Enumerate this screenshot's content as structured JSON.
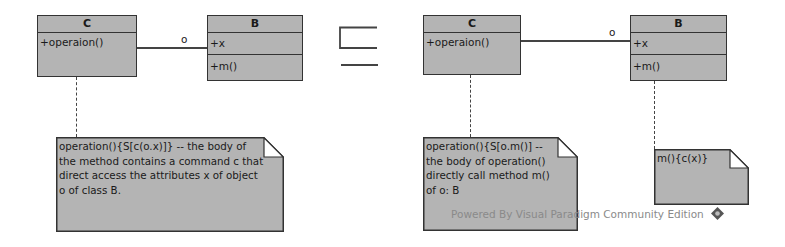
{
  "left_diagram": {
    "class_c": {
      "name": "C",
      "operations": [
        "+operaion()"
      ]
    },
    "class_b": {
      "name": "B",
      "attributes": [
        "+x"
      ],
      "operations": [
        "+m()"
      ]
    },
    "association_label": "o",
    "note": "operation(){S[c(o.x)]} -- the body of the method contains a command c that direct access the attributes x of object o of class B."
  },
  "relation_symbol": "⊑",
  "right_diagram": {
    "class_c": {
      "name": "C",
      "operations": [
        "+operaion()"
      ]
    },
    "class_b": {
      "name": "B",
      "attributes": [
        "+x"
      ],
      "operations": [
        "+m()"
      ]
    },
    "association_label": "o",
    "note_c": "operation(){S[o.m()] -- the body of operation() directly call method m() of o: B",
    "note_b": "m(){c(x)}"
  },
  "watermark": {
    "text": "Powered By Visual Paradigm Community Edition",
    "icon": "visual-paradigm-logo-icon"
  },
  "colors": {
    "box_fill": "#b4b4b4",
    "border": "#333333",
    "watermark": "#8a8a8a"
  }
}
